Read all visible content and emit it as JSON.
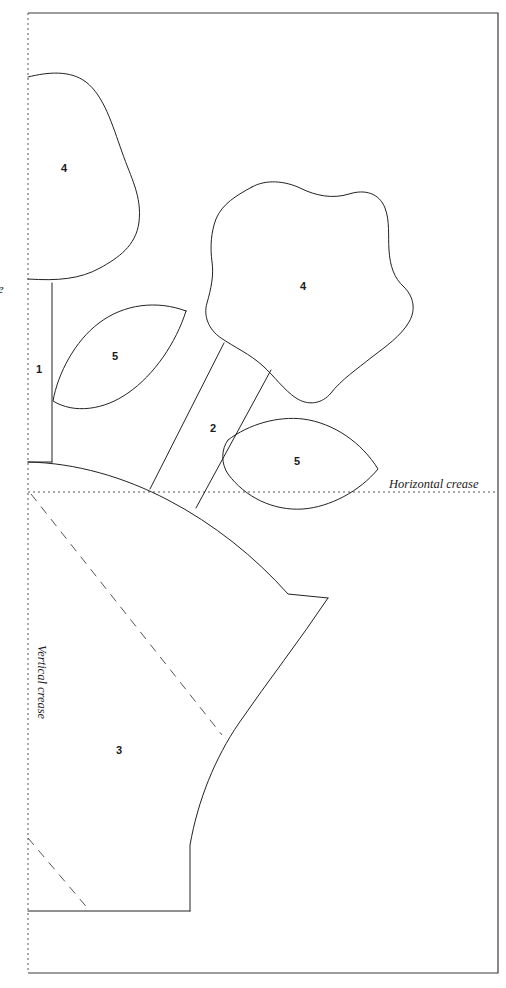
{
  "diagram": {
    "background_color": "#ffffff",
    "line_color": "#222222",
    "crease_color": "#555555",
    "frame_color": "#3a3a3a",
    "width": 506,
    "height": 988
  },
  "creases": {
    "horizontal": {
      "label": "Horizontal crease",
      "style": "dotted",
      "y": 492
    },
    "vertical": {
      "label": "Vertical crease",
      "style": "dotted",
      "x": 28,
      "orientation": "rotated-90"
    }
  },
  "piece_labels": [
    {
      "id": "1",
      "text": "1",
      "x": 39,
      "y": 370
    },
    {
      "id": "2",
      "text": "2",
      "x": 213,
      "y": 429
    },
    {
      "id": "3",
      "text": "3",
      "x": 119,
      "y": 751
    },
    {
      "id": "4a",
      "text": "4",
      "x": 64,
      "y": 169
    },
    {
      "id": "4b",
      "text": "4",
      "x": 303,
      "y": 287
    },
    {
      "id": "5a",
      "text": "5",
      "x": 115,
      "y": 357
    },
    {
      "id": "5b",
      "text": "5",
      "x": 297,
      "y": 462
    }
  ],
  "edge_fragment": {
    "text": "e",
    "x": 1,
    "y": 290,
    "note": "clipped text at left edge"
  }
}
